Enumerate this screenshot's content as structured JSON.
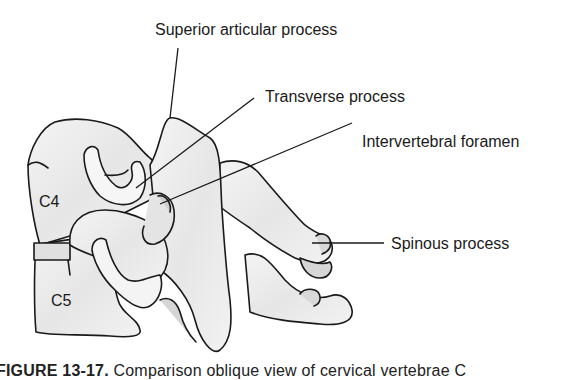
{
  "figure": {
    "labels": {
      "superior_articular_process": "Superior articular process",
      "transverse_process": "Transverse process",
      "intervertebral_foramen": "Intervertebral foramen",
      "spinous_process": "Spinous process"
    },
    "vertebrae": {
      "upper": "C4",
      "lower": "C5"
    },
    "caption": {
      "number": "FIGURE 13-17.",
      "text": "Comparison oblique view of cervical vertebrae C"
    },
    "colors": {
      "outline": "#1a1a1a",
      "bone_fill": "#f1f1f1",
      "shade": "#d4d4d4",
      "background": "#ffffff"
    }
  }
}
